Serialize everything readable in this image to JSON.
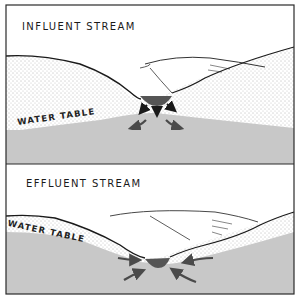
{
  "panels": [
    {
      "title": "INFLUENT STREAM",
      "water_table_label": "WATER TABLE",
      "flow_direction": "outward from stream into ground water"
    },
    {
      "title": "EFFLUENT STREAM",
      "water_table_label": "WATER TABLE",
      "flow_direction": "inward from ground water into stream"
    }
  ],
  "colors": {
    "groundwater": "#c8c8c8",
    "stream": "#555555",
    "arrows": "#4a4a4a",
    "outline": "#2a2a2a",
    "soil_dots": "#6a6a6a"
  }
}
